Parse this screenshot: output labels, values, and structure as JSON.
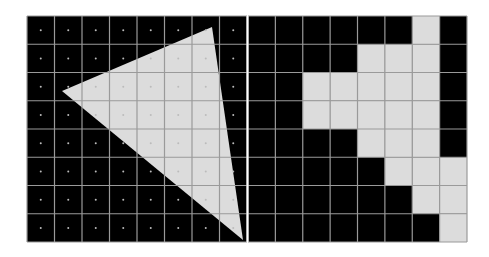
{
  "diagram": {
    "grid": {
      "rows": 8,
      "cols": 8
    },
    "colors": {
      "background": "#000000",
      "fill": "#dcdcdc",
      "grid_line": "#9a9a9a",
      "sample_dot": "#bbbbbb",
      "divider": "#ffffff"
    },
    "left_panel": {
      "x": 27,
      "y": 16,
      "width": 220,
      "height": 226,
      "triangle": [
        [
          212,
          27
        ],
        [
          62,
          91
        ],
        [
          243,
          240
        ]
      ],
      "show_sample_points": true
    },
    "right_panel": {
      "x": 248,
      "y": 16,
      "width": 219,
      "height": 226,
      "filled_cells": [
        [
          6
        ],
        [
          4,
          5,
          6
        ],
        [
          2,
          3,
          4,
          5,
          6
        ],
        [
          2,
          3,
          4,
          5,
          6
        ],
        [
          4,
          5,
          6
        ],
        [
          5,
          6,
          7
        ],
        [
          6,
          7
        ],
        [
          7
        ]
      ]
    }
  }
}
